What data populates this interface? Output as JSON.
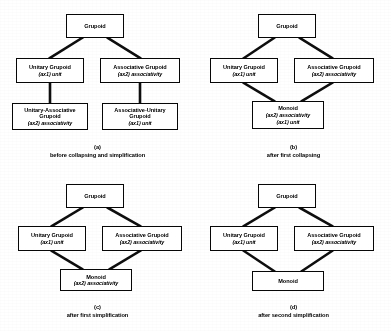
{
  "labels": {
    "grupoid": "Grupoid",
    "unitary_grupoid": "Unitary Grupoid",
    "associative_grupoid": "Associative Grupoid",
    "unitary_associative_grupoid": "Unitary-Associative Grupoid",
    "associative_unitary_grupoid": "Associative-Unitary Grupoid",
    "monoid": "Monoid",
    "ax1_unit": "(ax1) unit",
    "ax2_associativity": "(ax2) associativity",
    "empty": ""
  },
  "panels": [
    {
      "id": "a",
      "caption_label": "(a)",
      "caption_text": "before collapsing and simplification",
      "nodes": [
        {
          "name": "grupoid",
          "title": "Grupoid",
          "axioms": []
        },
        {
          "name": "unitary-grupoid",
          "title": "Unitary Grupoid",
          "axioms": [
            "(ax1) unit"
          ]
        },
        {
          "name": "associative-grupoid",
          "title": "Associative Grupoid",
          "axioms": [
            "(ax2) associativity"
          ]
        },
        {
          "name": "unitary-associative-grupoid",
          "title": "Unitary-Associative Grupoid",
          "axioms": [
            "(ax2) associativity"
          ]
        },
        {
          "name": "associative-unitary-grupoid",
          "title": "Associative-Unitary Grupoid",
          "axioms": [
            "(ax1) unit"
          ]
        }
      ],
      "edges": [
        [
          "grupoid",
          "unitary-grupoid"
        ],
        [
          "grupoid",
          "associative-grupoid"
        ],
        [
          "unitary-grupoid",
          "unitary-associative-grupoid"
        ],
        [
          "associative-grupoid",
          "associative-unitary-grupoid"
        ]
      ]
    },
    {
      "id": "b",
      "caption_label": "(b)",
      "caption_text": "after first collapsing",
      "nodes": [
        {
          "name": "grupoid",
          "title": "Grupoid",
          "axioms": []
        },
        {
          "name": "unitary-grupoid",
          "title": "Unitary Grupoid",
          "axioms": [
            "(ax1) unit"
          ]
        },
        {
          "name": "associative-grupoid",
          "title": "Associative Grupoid",
          "axioms": [
            "(ax2) associativity"
          ]
        },
        {
          "name": "monoid",
          "title": "Monoid",
          "axioms": [
            "(ax2) associativity",
            "(ax1) unit"
          ]
        }
      ],
      "edges": [
        [
          "grupoid",
          "unitary-grupoid"
        ],
        [
          "grupoid",
          "associative-grupoid"
        ],
        [
          "unitary-grupoid",
          "monoid"
        ],
        [
          "associative-grupoid",
          "monoid"
        ]
      ]
    },
    {
      "id": "c",
      "caption_label": "(c)",
      "caption_text": "after first simplification",
      "nodes": [
        {
          "name": "grupoid",
          "title": "Grupoid",
          "axioms": []
        },
        {
          "name": "unitary-grupoid",
          "title": "Unitary Grupoid",
          "axioms": [
            "(ax1) unit"
          ]
        },
        {
          "name": "associative-grupoid",
          "title": "Associative Grupoid",
          "axioms": [
            "(ax2) associativity"
          ]
        },
        {
          "name": "monoid",
          "title": "Monoid",
          "axioms": [
            "(ax2) associativity"
          ]
        }
      ],
      "edges": [
        [
          "grupoid",
          "unitary-grupoid"
        ],
        [
          "grupoid",
          "associative-grupoid"
        ],
        [
          "unitary-grupoid",
          "monoid"
        ],
        [
          "associative-grupoid",
          "monoid"
        ]
      ]
    },
    {
      "id": "d",
      "caption_label": "(d)",
      "caption_text": "after second simplification",
      "nodes": [
        {
          "name": "grupoid",
          "title": "Grupoid",
          "axioms": []
        },
        {
          "name": "unitary-grupoid",
          "title": "Unitary Grupoid",
          "axioms": [
            "(ax1) unit"
          ]
        },
        {
          "name": "associative-grupoid",
          "title": "Associative Grupoid",
          "axioms": [
            "(ax2) associativity"
          ]
        },
        {
          "name": "monoid",
          "title": "Monoid",
          "axioms": []
        }
      ],
      "edges": [
        [
          "grupoid",
          "unitary-grupoid"
        ],
        [
          "grupoid",
          "associative-grupoid"
        ],
        [
          "unitary-grupoid",
          "monoid"
        ],
        [
          "associative-grupoid",
          "monoid"
        ]
      ]
    }
  ]
}
